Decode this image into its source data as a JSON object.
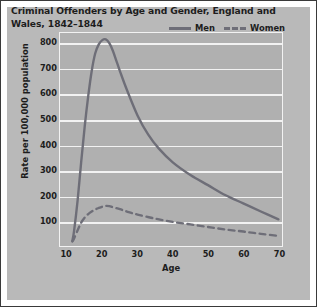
{
  "chart_data": {
    "type": "line",
    "title": "Criminal Offenders by Age and Gender, England and Wales, 1842–1844",
    "xlabel": "Age",
    "ylabel": "Rate per 100,000 population",
    "xlim": [
      8,
      71
    ],
    "ylim": [
      0,
      840
    ],
    "xticks": [
      10,
      20,
      30,
      40,
      50,
      60,
      70
    ],
    "yticks": [
      100,
      200,
      300,
      400,
      500,
      600,
      700,
      800
    ],
    "grid": "horizontal",
    "legend_position": "top-right",
    "colors": {
      "line": "#6e6e78",
      "plot_background": "#b0b0b0",
      "panel_background": "#b9b9b9",
      "gridline": "#f2f2f2",
      "text": "#1d1d1d",
      "figure_border": "#3a3a3a"
    },
    "series": [
      {
        "name": "Men",
        "style": "solid",
        "x": [
          11.5,
          12,
          13,
          14,
          15,
          16,
          17,
          18,
          19,
          20,
          21,
          22,
          23,
          24,
          25,
          27,
          30,
          33,
          36,
          40,
          45,
          50,
          55,
          60,
          65,
          70
        ],
        "values": [
          20,
          60,
          180,
          330,
          470,
          590,
          690,
          760,
          795,
          812,
          815,
          800,
          770,
          730,
          690,
          615,
          515,
          440,
          385,
          330,
          280,
          240,
          200,
          168,
          136,
          105
        ]
      },
      {
        "name": "Women",
        "style": "dashed",
        "x": [
          11.5,
          12,
          13,
          14,
          15,
          16,
          17,
          18,
          19,
          20,
          21,
          22,
          23,
          25,
          27,
          30,
          35,
          40,
          45,
          50,
          55,
          60,
          65,
          70
        ],
        "values": [
          18,
          30,
          62,
          92,
          112,
          126,
          136,
          144,
          150,
          155,
          158,
          157,
          153,
          145,
          136,
          124,
          108,
          95,
          85,
          75,
          65,
          57,
          48,
          40
        ]
      }
    ]
  },
  "legend": {
    "entries": [
      {
        "label": "Men",
        "style": "solid"
      },
      {
        "label": "Women",
        "style": "dashed"
      }
    ]
  }
}
